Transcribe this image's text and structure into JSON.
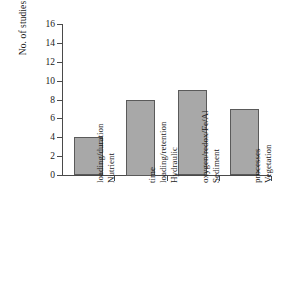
{
  "chart_data": {
    "type": "bar",
    "title": "",
    "xlabel": "",
    "ylabel": "No. of studies",
    "categories": [
      "Nutrient loading/duration",
      "Hydraulic loading/retention time",
      "Sediment oxygen/redox/Fe/Al",
      "Vegetation processes"
    ],
    "category_lines": [
      [
        "Nutrient",
        "loading/duration"
      ],
      [
        "Hydraulic",
        "loading/retention",
        "time"
      ],
      [
        "Sediment",
        "oxygen/redox/Fe/Al"
      ],
      [
        "Vegetation",
        "processes"
      ]
    ],
    "values": [
      4,
      8,
      9,
      7
    ],
    "ylim": [
      0,
      16
    ],
    "ytick_step": 2,
    "ytick_labels": [
      "0",
      "2",
      "4",
      "6",
      "8",
      "10",
      "12",
      "14",
      "16"
    ],
    "grid": false,
    "legend": null,
    "bar_fill_color": "#a8a8a8",
    "bar_edge_color": "#5a5a5a",
    "axis_color": "#4a4a4a",
    "background_color": "#ffffff"
  }
}
